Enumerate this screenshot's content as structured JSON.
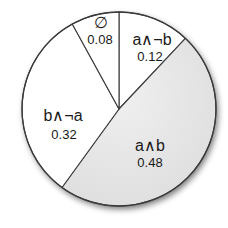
{
  "chart_data": {
    "type": "pie",
    "title": "",
    "categories": [
      "a∧¬b",
      "a∧b",
      "b∧¬a",
      "∅"
    ],
    "values": [
      0.12,
      0.48,
      0.32,
      0.08
    ],
    "labels": [
      "0.12",
      "0.48",
      "0.32",
      "0.08"
    ],
    "start_angle_deg": 0,
    "direction": "clockwise",
    "colors": [
      "#ffffff",
      "#e6e6e6",
      "#ffffff",
      "#ffffff"
    ],
    "stroke_color": "#3a3a3a",
    "legend": "none"
  },
  "slices": [
    {
      "name": "a∧¬b",
      "value": "0.12"
    },
    {
      "name": "a∧b",
      "value": "0.48"
    },
    {
      "name": "b∧¬a",
      "value": "0.32"
    },
    {
      "name": "∅",
      "value": "0.08"
    }
  ]
}
